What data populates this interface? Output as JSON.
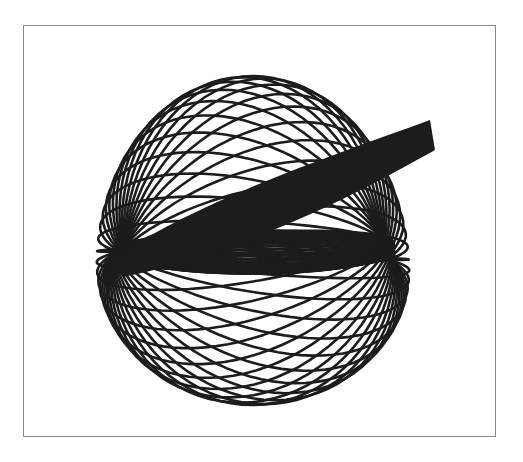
{
  "figure": {
    "line_color": "#1c1c1c",
    "background": "#ffffff",
    "frame_color": "#8a8a8a"
  },
  "geometry": {
    "pivot_left": [
      118,
      252
    ],
    "pivot_right": [
      388,
      250
    ],
    "loop_count": 44,
    "stroke_width": 2.6,
    "extent": {
      "top": 57,
      "bottom": 400,
      "left": 86,
      "right": 442
    }
  }
}
